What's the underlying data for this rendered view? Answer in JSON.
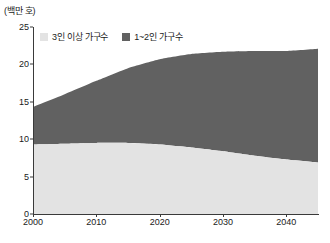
{
  "unit_label": "(백만 호)",
  "legend": {
    "position": "top-left-inside",
    "items": [
      {
        "label": "3인 이상 가구수",
        "color": "#e3e3e3",
        "swatch_name": "legend-swatch-large-households"
      },
      {
        "label": "1~2인 가구수",
        "color": "#616161",
        "swatch_name": "legend-swatch-small-households"
      }
    ]
  },
  "axes": {
    "y_ticks": [
      "0",
      "5",
      "10",
      "15",
      "20",
      "25"
    ],
    "x_ticks": [
      "2000",
      "2010",
      "2020",
      "2030",
      "2040"
    ]
  },
  "chart_data": {
    "type": "area",
    "stacked": true,
    "title": "",
    "subtitle": "",
    "xlabel": "",
    "ylabel": "(백만 호)",
    "xlim": [
      2000,
      2045
    ],
    "ylim": [
      0,
      25
    ],
    "grid": false,
    "legend_position": "top-left-inside",
    "x": [
      2000,
      2005,
      2010,
      2015,
      2020,
      2025,
      2030,
      2035,
      2040,
      2045
    ],
    "series": [
      {
        "name": "3인 이상 가구수",
        "color": "#e3e3e3",
        "values": [
          9.3,
          9.4,
          9.5,
          9.5,
          9.3,
          8.9,
          8.4,
          7.8,
          7.3,
          6.9
        ]
      },
      {
        "name": "1~2인 가구수",
        "color": "#616161",
        "values": [
          5.0,
          6.6,
          8.3,
          10.0,
          11.4,
          12.5,
          13.3,
          14.0,
          14.5,
          15.2
        ]
      }
    ],
    "totals": [
      14.3,
      16.0,
      17.8,
      19.5,
      20.7,
      21.4,
      21.7,
      21.8,
      21.8,
      22.1
    ]
  }
}
